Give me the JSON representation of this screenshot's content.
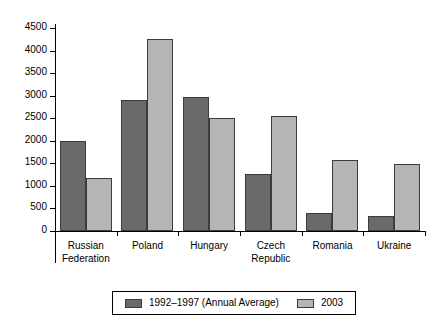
{
  "chart_data": {
    "type": "bar",
    "title": "",
    "subtitle": "",
    "xlabel": "",
    "ylabel": "",
    "ylim": [
      0,
      4500
    ],
    "ytick_step": 500,
    "yticks": [
      "0",
      "500",
      "1000",
      "1500",
      "2000",
      "2500",
      "3000",
      "3500",
      "4000",
      "4500"
    ],
    "grid": false,
    "legend_position": "bottom",
    "categories": [
      "Russian\nFederation",
      "Poland",
      "Hungary",
      "Czech\nRepublic",
      "Romania",
      "Ukraine"
    ],
    "series": [
      {
        "name": "1992–1997 (Annual Average)",
        "color": "#6a6a6a",
        "values": [
          2000,
          2900,
          2970,
          1265,
          400,
          335
        ]
      },
      {
        "name": "2003",
        "color": "#b5b5b5",
        "values": [
          1175,
          4250,
          2500,
          2550,
          1570,
          1480
        ]
      }
    ]
  },
  "legend": {
    "entries": [
      {
        "label": "1992–1997 (Annual Average)"
      },
      {
        "label": "2003"
      }
    ]
  }
}
